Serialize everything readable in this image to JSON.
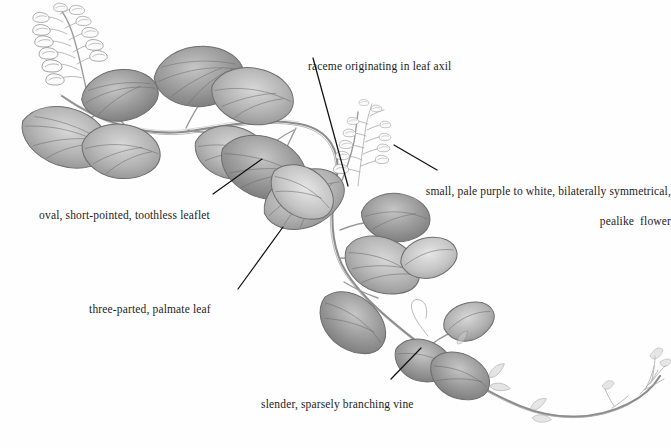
{
  "figure": {
    "background_color": "#fefefe",
    "ink_color": "#1c1c1c",
    "pencil_color": "#8c8c8c"
  },
  "annotations": [
    {
      "id": "raceme-axil",
      "text": "raceme originating in leaf axil",
      "line1": "raceme originating in leaf axil",
      "line2": "",
      "align": "left",
      "text_x": 296,
      "text_y": 44,
      "leader": {
        "x1": 313,
        "y1": 58,
        "x2": 348,
        "y2": 186
      }
    },
    {
      "id": "pealike-flower",
      "text": "small, pale purple to white, bilaterally symmetrical, pealike flower",
      "line1": "small, pale purple to white, bilaterally symmetrical,",
      "line2": "pealike  flower",
      "align": "right",
      "text_x": 399,
      "text_y": 169,
      "leader": {
        "x1": 437,
        "y1": 170,
        "x2": 394,
        "y2": 145
      }
    },
    {
      "id": "toothless-leaflet",
      "text": "oval, short-pointed, toothless leaflet",
      "line1": "oval, short-pointed, toothless leaflet",
      "line2": "",
      "align": "left",
      "text_x": 27,
      "text_y": 193,
      "leader": {
        "x1": 213,
        "y1": 194,
        "x2": 262,
        "y2": 159
      }
    },
    {
      "id": "palmate-leaf",
      "text": "three-parted, palmate leaf",
      "line1": "three-parted, palmate leaf",
      "line2": "",
      "align": "left",
      "text_x": 77,
      "text_y": 287,
      "leader": {
        "x1": 238,
        "y1": 289,
        "x2": 283,
        "y2": 227
      }
    },
    {
      "id": "branching-vine",
      "text": "slender, sparsely branching vine",
      "line1": "slender, sparsely branching vine",
      "line2": "",
      "align": "left",
      "text_x": 249,
      "text_y": 382,
      "leader": {
        "x1": 391,
        "y1": 379,
        "x2": 421,
        "y2": 348
      }
    }
  ],
  "plant_parts": [
    {
      "name": "upper-left-raceme",
      "label": "raceme of pealike flowers"
    },
    {
      "name": "central-raceme",
      "label": "raceme originating in leaf axil"
    },
    {
      "name": "trifoliate-leaf-cluster-upper-left",
      "label": "three-parted palmate leaf"
    },
    {
      "name": "trifoliate-leaf-cluster-upper-middle",
      "label": "three-parted palmate leaf"
    },
    {
      "name": "trifoliate-leaf-cluster-middle",
      "label": "three-parted palmate leaf"
    },
    {
      "name": "trifoliate-leaf-cluster-lower-right",
      "label": "three-parted palmate leaf"
    },
    {
      "name": "main-vine-stem",
      "label": "slender sparsely branching vine"
    },
    {
      "name": "vine-tip-bracts",
      "label": "terminal bracts"
    }
  ]
}
